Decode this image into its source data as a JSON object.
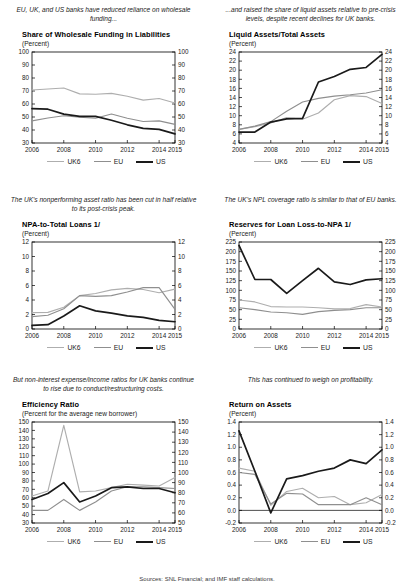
{
  "figure": {
    "series_names": [
      "UK6",
      "EU",
      "US"
    ],
    "colors": {
      "uk6": "#aeaeae",
      "eu": "#8f8f8f",
      "us": "#1a1a1a"
    },
    "footnote": "Sources: SNL Financial; and IMF staff calculations."
  },
  "legend": {
    "uk6": "UK6",
    "eu": "EU",
    "us": "US"
  },
  "panels": [
    {
      "caption": "EU, UK, and US banks have reduced reliance on wholesale funding...",
      "title": "Share of Wholesale Funding in Liabilities",
      "subtitle": "(Percent)"
    },
    {
      "caption": "...and raised the share of liquid assets relative to pre-crisis levels, despite recent declines for UK banks.",
      "title": "Liquid Assets/Total Assets",
      "subtitle": "(Percent)"
    },
    {
      "caption": "The UK's nonperforming asset ratio has been cut in half relative to its post-crisis peak.",
      "title": "NPA-to-Total Loans 1/",
      "subtitle": "(Percent)"
    },
    {
      "caption": "The UK's NPL coverage ratio is similar to that of EU banks.",
      "title": "Reserves for Loan Loss-to-NPA 1/",
      "subtitle": "(Percent)"
    },
    {
      "caption": "But non-interest expense/income ratios for UK banks continue to rise due to conduct/restructuring costs.",
      "title": "Efficiency Ratio",
      "subtitle": "(Percent for the average new borrower)"
    },
    {
      "caption": "This has continued to weigh on profitability.",
      "title": "Return on Assets",
      "subtitle": "(Percent)"
    }
  ],
  "chart_data": [
    {
      "type": "line",
      "title": "Share of Wholesale Funding in Liabilities",
      "xlabel": "",
      "ylabel": "Percent",
      "x": [
        2006,
        2007,
        2008,
        2009,
        2010,
        2011,
        2012,
        2013,
        2014,
        2015
      ],
      "xticklabels": [
        "2006",
        "2008",
        "2010",
        "2012",
        "2014",
        "2015"
      ],
      "ylim": [
        30,
        100
      ],
      "yticks": [
        30,
        40,
        50,
        60,
        70,
        80,
        90,
        100
      ],
      "ylim_right": [
        30,
        100
      ],
      "yticks_right": [
        30,
        40,
        50,
        60,
        70,
        80,
        90,
        100
      ],
      "grid": false,
      "legend": "bottom",
      "series": [
        {
          "name": "UK6",
          "values": [
            70.8,
            71.5,
            72.3,
            67.8,
            67.5,
            68.2,
            66.0,
            63.0,
            64.2,
            60.8
          ]
        },
        {
          "name": "EU",
          "values": [
            47.0,
            49.2,
            51.0,
            49.8,
            49.0,
            52.3,
            49.0,
            46.5,
            47.0,
            44.3
          ]
        },
        {
          "name": "US",
          "values": [
            56.5,
            56.0,
            52.2,
            50.5,
            50.5,
            47.5,
            44.0,
            41.2,
            40.5,
            37.0
          ]
        }
      ]
    },
    {
      "type": "line",
      "title": "Liquid Assets/Total Assets",
      "xlabel": "",
      "ylabel": "Percent",
      "x": [
        2006,
        2007,
        2008,
        2009,
        2010,
        2011,
        2012,
        2013,
        2014,
        2015
      ],
      "xticklabels": [
        "2006",
        "2008",
        "2010",
        "2012",
        "2014",
        "2015"
      ],
      "ylim": [
        4,
        24
      ],
      "yticks": [
        4,
        6,
        8,
        10,
        12,
        14,
        16,
        18,
        20,
        22,
        24
      ],
      "ylim_right": [
        4,
        24
      ],
      "yticks_right": [
        4,
        6,
        8,
        10,
        12,
        14,
        16,
        18,
        20,
        22,
        24
      ],
      "grid": false,
      "legend": "bottom",
      "series": [
        {
          "name": "UK6",
          "values": [
            7.0,
            7.6,
            8.4,
            9.6,
            9.2,
            10.6,
            13.5,
            14.4,
            14.2,
            12.7
          ]
        },
        {
          "name": "EU",
          "values": [
            7.0,
            7.7,
            8.7,
            11.0,
            13.0,
            13.8,
            14.3,
            14.6,
            15.0,
            15.7
          ]
        },
        {
          "name": "US",
          "values": [
            6.4,
            6.4,
            8.6,
            9.3,
            9.4,
            17.4,
            18.6,
            20.2,
            20.6,
            23.5
          ]
        }
      ]
    },
    {
      "type": "line",
      "title": "NPA-to-Total Loans 1/",
      "xlabel": "",
      "ylabel": "Percent",
      "x": [
        2006,
        2007,
        2008,
        2009,
        2010,
        2011,
        2012,
        2013,
        2014,
        2015
      ],
      "xticklabels": [
        "2006",
        "2008",
        "2010",
        "2012",
        "2014",
        "2015"
      ],
      "ylim": [
        0,
        12
      ],
      "yticks": [
        0,
        2,
        4,
        6,
        8,
        10,
        12
      ],
      "ylim_right": [
        0,
        12
      ],
      "yticks_right": [
        0,
        2,
        4,
        6,
        8,
        10,
        12
      ],
      "grid": false,
      "legend": "bottom",
      "series": [
        {
          "name": "UK6",
          "values": [
            2.25,
            2.3,
            3.0,
            4.6,
            4.9,
            5.4,
            5.6,
            5.45,
            5.0,
            5.5
          ]
        },
        {
          "name": "EU",
          "values": [
            1.7,
            1.9,
            2.8,
            4.6,
            4.5,
            4.6,
            5.1,
            5.7,
            5.7,
            2.7
          ]
        },
        {
          "name": "US",
          "values": [
            0.5,
            0.6,
            1.8,
            3.2,
            2.5,
            2.2,
            1.8,
            1.6,
            1.2,
            1.0
          ]
        }
      ]
    },
    {
      "type": "line",
      "title": "Reserves for Loan Loss-to-NPA 1/",
      "xlabel": "",
      "ylabel": "Percent",
      "x": [
        2006,
        2007,
        2008,
        2009,
        2010,
        2011,
        2012,
        2013,
        2014,
        2015
      ],
      "xticklabels": [
        "2006",
        "2008",
        "2010",
        "2012",
        "2014",
        "2015"
      ],
      "ylim": [
        0,
        225
      ],
      "yticks": [
        0,
        25,
        50,
        75,
        100,
        125,
        150,
        175,
        200,
        225
      ],
      "ylim_right": [
        0,
        225
      ],
      "yticks_right": [
        0,
        25,
        50,
        75,
        100,
        125,
        150,
        175,
        200,
        225
      ],
      "grid": false,
      "legend": "bottom",
      "series": [
        {
          "name": "UK6",
          "values": [
            75,
            70,
            58,
            57,
            57,
            55,
            52,
            53,
            63,
            57
          ]
        },
        {
          "name": "EU",
          "values": [
            55,
            50,
            44,
            42,
            38,
            45,
            48,
            50,
            55,
            55
          ]
        },
        {
          "name": "US",
          "values": [
            216,
            128,
            128,
            92,
            125,
            157,
            122,
            115,
            127,
            130
          ]
        }
      ]
    },
    {
      "type": "line",
      "title": "Efficiency Ratio",
      "xlabel": "",
      "ylabel": "Percent for the average new borrower",
      "x": [
        2006,
        2007,
        2008,
        2009,
        2010,
        2011,
        2012,
        2013,
        2014,
        2015
      ],
      "xticklabels": [
        "2006",
        "2008",
        "2010",
        "2012",
        "2014",
        "2015"
      ],
      "ylim": [
        30,
        150
      ],
      "yticks": [
        30,
        40,
        50,
        60,
        70,
        80,
        90,
        100,
        110,
        120,
        130,
        140,
        150
      ],
      "ylim_right": [
        50,
        150
      ],
      "yticks_right": [
        50,
        60,
        70,
        80,
        90,
        100,
        110,
        120,
        130,
        140,
        150
      ],
      "grid": false,
      "legend": "bottom",
      "series": [
        {
          "name": "UK6",
          "values": [
            62,
            68,
            146,
            67,
            68,
            72,
            76,
            75,
            74,
            84
          ]
        },
        {
          "name": "EU",
          "values": [
            45,
            45,
            58,
            45,
            55,
            68,
            73,
            73,
            72,
            71
          ]
        },
        {
          "name": "US",
          "values": [
            58,
            65,
            78,
            55,
            62,
            72,
            73,
            71,
            71,
            66
          ]
        }
      ]
    },
    {
      "type": "line",
      "title": "Return on Assets",
      "xlabel": "",
      "ylabel": "Percent",
      "x": [
        2006,
        2007,
        2008,
        2009,
        2010,
        2011,
        2012,
        2013,
        2014,
        2015
      ],
      "xticklabels": [
        "2006",
        "2008",
        "2010",
        "2012",
        "2014",
        "2015"
      ],
      "ylim": [
        -0.2,
        1.4
      ],
      "yticks": [
        -0.2,
        0.0,
        0.2,
        0.4,
        0.6,
        0.8,
        1.0,
        1.2,
        1.4
      ],
      "ylim_right": [
        -0.2,
        1.4
      ],
      "yticks_right": [
        -0.2,
        0.0,
        0.2,
        0.4,
        0.6,
        0.8,
        1.0,
        1.2,
        1.4
      ],
      "grid": false,
      "legend": "bottom",
      "series": [
        {
          "name": "UK6",
          "values": [
            0.67,
            0.62,
            0.08,
            0.3,
            0.35,
            0.2,
            0.22,
            0.09,
            0.12,
            0.25
          ]
        },
        {
          "name": "EU",
          "values": [
            0.6,
            0.57,
            0.1,
            0.27,
            0.26,
            0.09,
            0.09,
            0.09,
            0.2,
            0.09
          ]
        },
        {
          "name": "US",
          "values": [
            1.26,
            0.62,
            -0.04,
            0.5,
            0.55,
            0.62,
            0.67,
            0.8,
            0.74,
            0.96
          ]
        }
      ]
    }
  ]
}
